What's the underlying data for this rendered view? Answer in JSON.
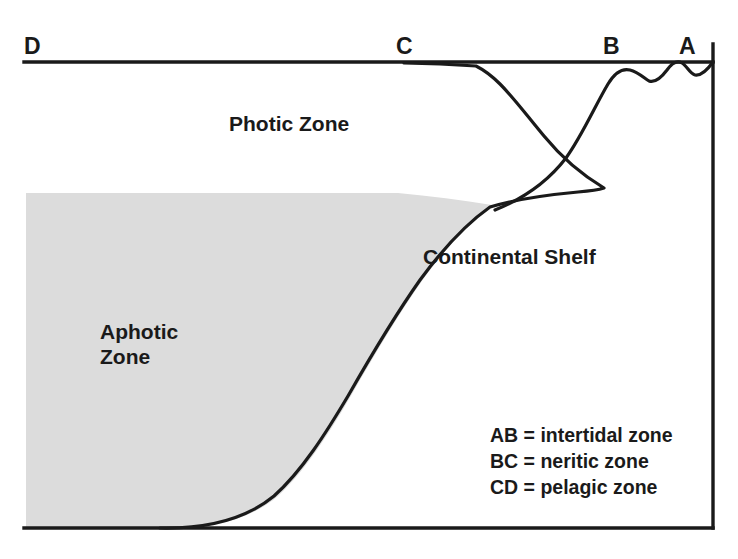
{
  "diagram": {
    "colors": {
      "line": "#1a1a1a",
      "aphotic_fill": "#dcdcdc",
      "background": "#ffffff",
      "text": "#1a1a1a"
    },
    "point_labels": [
      {
        "id": "D",
        "text": "D",
        "x": 24,
        "y": 33
      },
      {
        "id": "C",
        "text": "C",
        "x": 396,
        "y": 33
      },
      {
        "id": "B",
        "text": "B",
        "x": 603,
        "y": 33
      },
      {
        "id": "A",
        "text": "A",
        "x": 679,
        "y": 33
      }
    ],
    "zone_labels": [
      {
        "id": "photic",
        "text": "Photic Zone",
        "x": 229,
        "y": 112
      },
      {
        "id": "continental-shelf",
        "text": "Continental Shelf",
        "x": 423,
        "y": 245
      },
      {
        "id": "aphotic-line-1",
        "text": "Aphotic",
        "x": 100,
        "y": 320
      },
      {
        "id": "aphotic-line-2",
        "text": "Zone",
        "x": 100,
        "y": 345
      }
    ],
    "legend": [
      {
        "id": "ab",
        "text": "AB = intertidal zone"
      },
      {
        "id": "bc",
        "text": "BC = neritic zone"
      },
      {
        "id": "cd",
        "text": "CD = pelagic zone"
      }
    ],
    "geometry": {
      "sea_surface_y": 62,
      "seafloor_y": 528,
      "left_x": 24,
      "right_x": 713,
      "aphotic_top_y": 193
    }
  }
}
